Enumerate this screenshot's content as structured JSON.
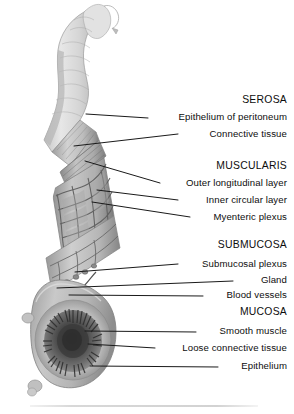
{
  "figure": {
    "background_color": "#ffffff",
    "leader_color": "#1a1a1a",
    "tissue_tone_light": "#dcdcdc",
    "tissue_tone_mid": "#b4b4b4",
    "tissue_tone_dark": "#6e6e6e"
  },
  "labels": [
    {
      "id": "serosa",
      "text": "SEROSA",
      "kind": "heading",
      "x_text": 287,
      "y": 104,
      "leader": null
    },
    {
      "id": "epithelium-peritoneum",
      "text": "Epithelium of peritoneum",
      "kind": "item",
      "x_text": 287,
      "y": 120,
      "leader": {
        "x1": 86,
        "y1": 114,
        "x2": 148,
        "y2": 118
      }
    },
    {
      "id": "connective-tissue",
      "text": "Connective tissue",
      "kind": "item",
      "x_text": 287,
      "y": 137,
      "leader": {
        "x1": 74,
        "y1": 146,
        "x2": 178,
        "y2": 134
      }
    },
    {
      "id": "muscularis",
      "text": "MUSCULARIS",
      "kind": "heading",
      "x_text": 287,
      "y": 170,
      "leader": null
    },
    {
      "id": "outer-longitudinal",
      "text": "Outer longitudinal layer",
      "kind": "item",
      "x_text": 287,
      "y": 186,
      "leader": {
        "x1": 85,
        "y1": 161,
        "x2": 160,
        "y2": 183
      }
    },
    {
      "id": "inner-circular",
      "text": "Inner circular layer",
      "kind": "item",
      "x_text": 287,
      "y": 203,
      "leader": {
        "x1": 97,
        "y1": 190,
        "x2": 178,
        "y2": 200
      }
    },
    {
      "id": "myenteric-plexus",
      "text": "Myenteric plexus",
      "kind": "item",
      "x_text": 287,
      "y": 220,
      "leader": {
        "x1": 92,
        "y1": 202,
        "x2": 190,
        "y2": 217
      }
    },
    {
      "id": "submucosa",
      "text": "SUBMUCOSA",
      "kind": "heading",
      "x_text": 287,
      "y": 249,
      "leader": null
    },
    {
      "id": "submucosal-plexus",
      "text": "Submucosal plexus",
      "kind": "item",
      "x_text": 287,
      "y": 267,
      "leader": {
        "x1": 75,
        "y1": 272,
        "x2": 178,
        "y2": 264
      }
    },
    {
      "id": "gland",
      "text": "Gland",
      "kind": "item",
      "x_text": 287,
      "y": 283,
      "leader": {
        "x1": 57,
        "y1": 288,
        "x2": 233,
        "y2": 281
      }
    },
    {
      "id": "blood-vessels",
      "text": "Blood vessels",
      "kind": "item",
      "x_text": 287,
      "y": 298,
      "leader": {
        "x1": 69,
        "y1": 295,
        "x2": 203,
        "y2": 296
      }
    },
    {
      "id": "mucosa",
      "text": "MUCOSA",
      "kind": "heading",
      "x_text": 287,
      "y": 316,
      "leader": null
    },
    {
      "id": "smooth-muscle",
      "text": "Smooth muscle",
      "kind": "item",
      "x_text": 287,
      "y": 334,
      "leader": {
        "x1": 85,
        "y1": 331,
        "x2": 196,
        "y2": 332
      }
    },
    {
      "id": "loose-connective-tissue",
      "text": "Loose connective tissue",
      "kind": "item",
      "x_text": 287,
      "y": 351,
      "leader": {
        "x1": 88,
        "y1": 344,
        "x2": 155,
        "y2": 348
      }
    },
    {
      "id": "epithelium",
      "text": "Epithelium",
      "kind": "item",
      "x_text": 287,
      "y": 369,
      "leader": {
        "x1": 90,
        "y1": 366,
        "x2": 218,
        "y2": 367
      }
    }
  ]
}
